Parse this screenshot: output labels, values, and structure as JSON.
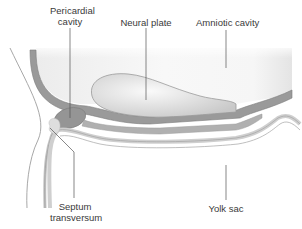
{
  "diagram": {
    "labels": {
      "pericardial_cavity_line1": "Pericardial",
      "pericardial_cavity_line2": "cavity",
      "neural_plate": "Neural plate",
      "amniotic_cavity": "Amniotic cavity",
      "septum_transversum_line1": "Septum",
      "septum_transversum_line2": "transversum",
      "yolk_sac": "Yolk sac"
    },
    "colors": {
      "dark_layer": "#8e8e8e",
      "mid_layer": "#b4b4b4",
      "light_fill": "#e6e6e6",
      "cavity_fill": "#f2f2f2",
      "outline": "#9a9a9a",
      "leader_line": "#555555",
      "text": "#3a3a3a"
    }
  }
}
